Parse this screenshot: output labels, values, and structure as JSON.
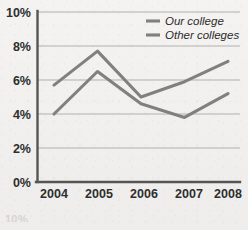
{
  "chart_data": {
    "type": "line",
    "title": "",
    "subtitle": "",
    "xlabel": "",
    "ylabel": "",
    "categories": [
      "2004",
      "2005",
      "2006",
      "2007",
      "2008"
    ],
    "x": [
      2004,
      2005,
      2006,
      2007,
      2008
    ],
    "series": [
      {
        "name": "Our college",
        "values": [
          5.7,
          7.7,
          5.0,
          5.9,
          7.1
        ],
        "color": "#808080"
      },
      {
        "name": "Other colleges",
        "values": [
          4.0,
          6.5,
          4.6,
          3.8,
          5.2
        ],
        "color": "#808080"
      }
    ],
    "ylim": [
      0,
      10
    ],
    "yticks": [
      0,
      2,
      4,
      6,
      8,
      10
    ],
    "ytick_labels": [
      "0%",
      "2%",
      "4%",
      "6%",
      "8%",
      "10%"
    ],
    "xtick_labels": [
      "2004",
      "2005",
      "2006",
      "2007",
      "2008"
    ],
    "grid": true,
    "grid_axis": "y",
    "legend_position": "top-right",
    "legend_entries": [
      "Our college",
      "Other colleges"
    ],
    "value_format": "percent"
  },
  "axes": {
    "y_labels": [
      "10%",
      "8%",
      "6%",
      "4%",
      "2%",
      "0%"
    ],
    "x_labels": [
      "2004",
      "2005",
      "2006",
      "2007",
      "2008"
    ]
  },
  "legend": {
    "items": [
      {
        "label": "Our college"
      },
      {
        "label": "Other colleges"
      }
    ]
  },
  "colors": {
    "line": "#808080",
    "grid": "#a9a9a9",
    "axis": "#555555",
    "text": "#2e2e2e",
    "background": "#f2f1ef"
  },
  "artifacts": {
    "bottom_fragment": "10%"
  }
}
